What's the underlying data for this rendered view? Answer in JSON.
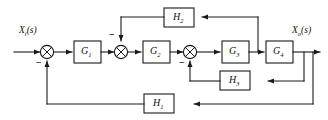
{
  "diagram": {
    "type": "control-system-block-diagram",
    "stroke_color": "#1a1a1a",
    "text_color": "#111111",
    "background": "#ffffff",
    "input": {
      "name": "input-signal",
      "base": "X",
      "subscript": "i",
      "suffix": "(s)",
      "full": "Xi(s)"
    },
    "output": {
      "name": "output-signal",
      "base": "X",
      "subscript": "o",
      "suffix": "(s)",
      "full": "Xo(s)"
    },
    "forward_blocks": [
      {
        "id": "G1",
        "base": "G",
        "subscript": "1"
      },
      {
        "id": "G2",
        "base": "G",
        "subscript": "2"
      },
      {
        "id": "G3",
        "base": "G",
        "subscript": "3"
      },
      {
        "id": "G4",
        "base": "G",
        "subscript": "4"
      }
    ],
    "feedback_blocks": [
      {
        "id": "H2",
        "base": "H",
        "subscript": "2",
        "position": "top"
      },
      {
        "id": "H3",
        "base": "H",
        "subscript": "3",
        "position": "middle"
      },
      {
        "id": "H1",
        "base": "H",
        "subscript": "1",
        "position": "bottom"
      }
    ],
    "summing_junctions": [
      {
        "id": "sum1",
        "sign": "−",
        "sign_position": "below-left"
      },
      {
        "id": "sum2",
        "sign": "−",
        "sign_position": "above-left"
      },
      {
        "id": "sum3",
        "sign": "−",
        "sign_position": "below-left"
      }
    ]
  }
}
